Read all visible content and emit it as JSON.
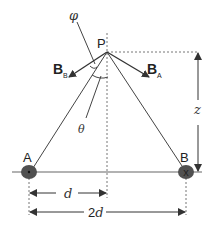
{
  "diagram": {
    "type": "physics-magnetic-field-two-wires",
    "points": {
      "P": {
        "label": "P",
        "x": 107,
        "y": 52
      },
      "A": {
        "label": "A",
        "x": 29,
        "y": 172,
        "symbol": "dot",
        "meaning": "current out of page"
      },
      "B": {
        "label": "B",
        "x": 186,
        "y": 172,
        "symbol": "x",
        "meaning": "current into page"
      }
    },
    "vectors": {
      "BB": {
        "main": "B",
        "sub": "B"
      },
      "BA": {
        "main": "B",
        "sub": "A"
      }
    },
    "angles": {
      "phi": "φ",
      "theta": "θ"
    },
    "dimensions": {
      "z": "z",
      "d_main": "d",
      "twod_prefix": "2",
      "twod_var": "d"
    },
    "colors": {
      "line": "#555555",
      "wire": "#505050",
      "dotted": "#777777",
      "arrow": "#333333"
    }
  }
}
